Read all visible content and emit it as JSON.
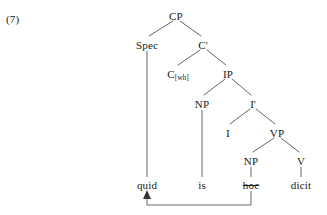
{
  "example": {
    "number_label": "(7)"
  },
  "diagram": {
    "type": "syntax-tree",
    "language_note": "Latin wh-movement",
    "line_color": "#555555",
    "text_color": "#1a1a1a",
    "background_color": "#ffffff",
    "nodes": [
      {
        "id": "CP",
        "label": "CP",
        "sublabel": "",
        "x": 176,
        "y": 16
      },
      {
        "id": "Spec",
        "label": "Spec",
        "sublabel": "",
        "x": 147,
        "y": 45
      },
      {
        "id": "Cbar",
        "label": "C'",
        "sublabel": "",
        "x": 203,
        "y": 45
      },
      {
        "id": "C",
        "label": "C",
        "sublabel": "[wh]",
        "x": 176,
        "y": 74
      },
      {
        "id": "IP",
        "label": "IP",
        "sublabel": "",
        "x": 228,
        "y": 74
      },
      {
        "id": "NP1",
        "label": "NP",
        "sublabel": "",
        "x": 202,
        "y": 104
      },
      {
        "id": "Ibar",
        "label": "I'",
        "sublabel": "",
        "x": 253,
        "y": 104
      },
      {
        "id": "I",
        "label": "I",
        "sublabel": "",
        "x": 228,
        "y": 133
      },
      {
        "id": "VP",
        "label": "VP",
        "sublabel": "",
        "x": 277,
        "y": 133
      },
      {
        "id": "NP2",
        "label": "NP",
        "sublabel": "",
        "x": 251,
        "y": 161
      },
      {
        "id": "V",
        "label": "V",
        "sublabel": "",
        "x": 301,
        "y": 161
      }
    ],
    "terminals": [
      {
        "id": "quid",
        "label": "quid",
        "x": 147,
        "y": 185,
        "struck": false,
        "parent": "Spec"
      },
      {
        "id": "is",
        "label": "is",
        "x": 202,
        "y": 185,
        "struck": false,
        "parent": "NP1"
      },
      {
        "id": "hoc",
        "label": "hoc",
        "x": 251,
        "y": 185,
        "struck": true,
        "parent": "NP2"
      },
      {
        "id": "dicit",
        "label": "dicit",
        "x": 301,
        "y": 185,
        "struck": false,
        "parent": "V"
      }
    ],
    "movement_arrow": {
      "from": "hoc",
      "to": "quid",
      "description": "wh-movement of hoc to specifier of CP position, surfacing as quid"
    }
  }
}
